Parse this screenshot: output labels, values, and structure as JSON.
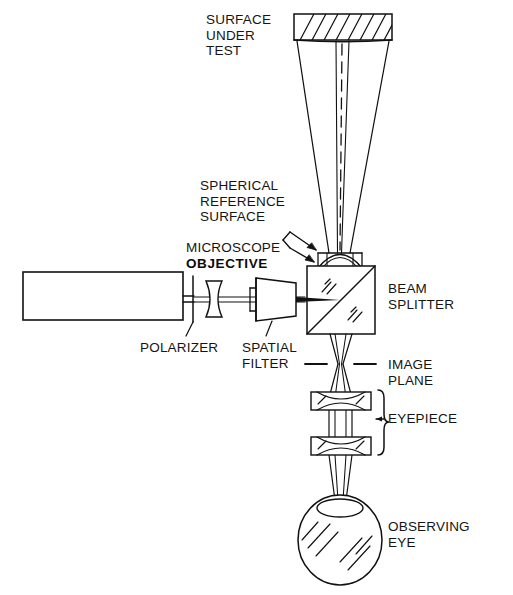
{
  "figure": {
    "background_color": "#ffffff",
    "line_color": "#111111",
    "width": 513,
    "height": 595
  },
  "labels": {
    "surface_under_test": "SURFACE\nUNDER\nTEST",
    "spherical_reference_surface": "SPHERICAL\nREFERENCE\nSURFACE",
    "microscope": "MICROSCOPE",
    "objective": "OBJECTIVE",
    "laser_prefix": "He - Ne ",
    "laser_name": "LASER",
    "beam_splitter": "BEAM\nSPLITTER",
    "polarizer": "POLARIZER",
    "spatial_filter": "SPATIAL\nFILTER",
    "image_plane": "IMAGE\nPLANE",
    "eyepiece": "EYEPIECE",
    "observing_eye": "OBSERVING\nEYE"
  },
  "components": {
    "surface_under_test": {
      "name": "surface-under-test",
      "hatched": true
    },
    "beam_splitter_cube": {
      "name": "beam-splitter-cube",
      "hatched_marks": true
    },
    "spherical_reference_surface": {
      "name": "spherical-reference-surface"
    },
    "microscope_objective": {
      "name": "microscope-objective"
    },
    "laser_source": {
      "name": "he-ne-laser-box"
    },
    "polarizer_element": {
      "name": "polarizer-element"
    },
    "spatial_filter_lens": {
      "name": "spatial-filter-lens"
    },
    "spatial_filter_body": {
      "name": "spatial-filter-body"
    },
    "eyepiece_lens_upper": {
      "name": "eyepiece-lens-upper"
    },
    "eyepiece_lens_lower": {
      "name": "eyepiece-lens-lower"
    },
    "image_plane_marker": {
      "name": "image-plane-marker"
    },
    "observing_eye": {
      "name": "observing-eye"
    },
    "optical_axis": {
      "name": "optical-axis-dashed"
    },
    "eyepiece_brace": {
      "name": "eyepiece-brace"
    },
    "pointer_arrows": {
      "name": "pointer-arrows"
    }
  }
}
